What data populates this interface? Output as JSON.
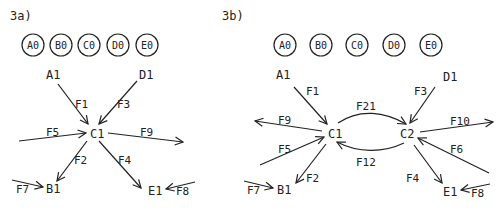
{
  "panels": [
    {
      "id": "3a",
      "label": "3a)",
      "states": [
        "A0",
        "B0",
        "C0",
        "D0",
        "E0"
      ],
      "nodes": {
        "A1": "A1",
        "D1": "D1",
        "C1": "C1",
        "B1": "B1",
        "E1": "E1"
      },
      "edges": {
        "F1": "F1",
        "F2": "F2",
        "F3": "F3",
        "F4": "F4",
        "F5": "F5",
        "F7": "F7",
        "F8": "F8",
        "F9": "F9"
      }
    },
    {
      "id": "3b",
      "label": "3b)",
      "states": [
        "A0",
        "B0",
        "C0",
        "D0",
        "E0"
      ],
      "nodes": {
        "A1": "A1",
        "D1": "D1",
        "C1": "C1",
        "C2": "C2",
        "B1": "B1",
        "E1": "E1"
      },
      "edges": {
        "F1": "F1",
        "F2": "F2",
        "F3": "F3",
        "F4": "F4",
        "F5": "F5",
        "F6": "F6",
        "F7": "F7",
        "F8": "F8",
        "F9": "F9",
        "F10": "F10",
        "F12": "F12",
        "F21": "F21"
      }
    }
  ]
}
